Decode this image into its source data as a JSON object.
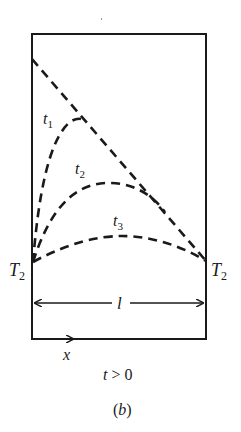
{
  "figure": {
    "panel_label": "(b)",
    "condition_label": "t > 0",
    "condition_var": "t",
    "condition_rest": " > 0",
    "length_label": "l",
    "x_axis_label": "x",
    "left_boundary_label": {
      "main": "T",
      "sub": "2"
    },
    "right_boundary_label": {
      "main": "T",
      "sub": "2"
    },
    "curves": [
      {
        "name": "initial-profile",
        "label": "",
        "description": "straight dashed line from high temperature at left to T2 at right"
      },
      {
        "name": "t1",
        "label_main": "t",
        "label_sub": "1"
      },
      {
        "name": "t2",
        "label_main": "t",
        "label_sub": "2"
      },
      {
        "name": "t3",
        "label_main": "t",
        "label_sub": "3"
      }
    ],
    "colors": {
      "ink": "#1a1a1a",
      "background": "#ffffff"
    }
  }
}
